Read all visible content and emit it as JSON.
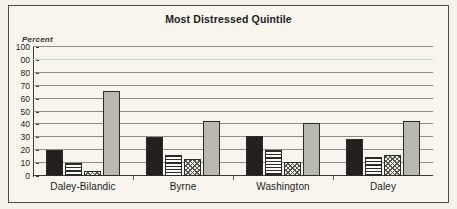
{
  "chart_data": {
    "type": "bar",
    "title": "Most Distressed Quintile",
    "subtitle": "",
    "xlabel": "",
    "ylabel": "Percent",
    "ylim": [
      0,
      100
    ],
    "grid": true,
    "legend": "none",
    "categories": [
      "Daley-Bilandic",
      "Byrne",
      "Washington",
      "Daley"
    ],
    "ytick_labels": [
      "100",
      "00",
      "80",
      "70",
      "60",
      "50",
      "40",
      "30",
      "20",
      "10",
      "0"
    ],
    "ytick_values": [
      100,
      90,
      80,
      70,
      60,
      50,
      40,
      30,
      20,
      10,
      0
    ],
    "series": [
      {
        "name": "series-1",
        "fill": "solid-black",
        "color": "#231f1c",
        "values": [
          20,
          30,
          31,
          29
        ]
      },
      {
        "name": "series-2",
        "fill": "horizontal-stripes",
        "color": "#2b2b27",
        "values": [
          10,
          16,
          20,
          15
        ]
      },
      {
        "name": "series-3",
        "fill": "checkered-hatch",
        "color": "#54544c",
        "values": [
          4,
          13,
          11,
          16
        ]
      },
      {
        "name": "series-4",
        "fill": "solid-gray",
        "color": "#b8b8b0",
        "values": [
          66,
          43,
          41,
          43
        ]
      }
    ]
  },
  "chart": {
    "title": "Most Distressed Quintile",
    "y_axis_caption": "Percent"
  },
  "colors": {
    "page_background": "#f4f2ea",
    "plot_background": "#f7f5ee",
    "frame_border": "#4a4a45",
    "gridline": "#8e8e85",
    "axis": "#3a3a35",
    "text": "#1d1d1b"
  }
}
